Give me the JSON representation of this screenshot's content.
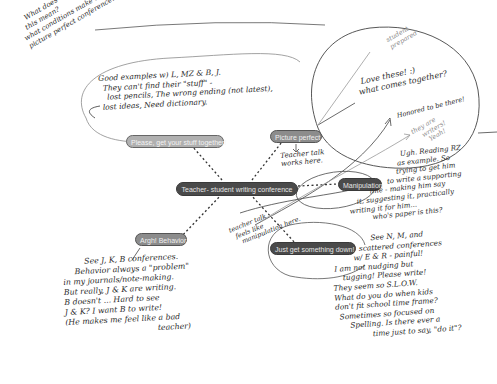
{
  "diagram": {
    "type": "mind-map",
    "central_node": {
      "label": "Teacher- student writing conference"
    },
    "branches": [
      {
        "id": "stuff",
        "label": "Please, get your stuff together!"
      },
      {
        "id": "picture",
        "label": "Picture perfect"
      },
      {
        "id": "manipulation",
        "label": "Manipulation"
      },
      {
        "id": "behavior",
        "label": "Argh! Behavior"
      },
      {
        "id": "down",
        "label": "Just get something down!"
      }
    ]
  },
  "annotations": {
    "top_left_question": {
      "lines": [
        "What does",
        "this mean?",
        "what conditions make a",
        "picture perfect conference?"
      ]
    },
    "stuff_note": {
      "lines": [
        "Good examples w) L, MZ & B, J.",
        "They can't find their \"stuff\" -",
        "lost pencils, The wrong ending (not latest),",
        "lost ideas, Need dictionary."
      ]
    },
    "student_prepared": {
      "lines": [
        "student",
        "prepared"
      ]
    },
    "picture_note": {
      "lines": [
        "Love these! :)",
        "what comes together?"
      ]
    },
    "honored_note": {
      "lines": [
        "Honored to be there!"
      ]
    },
    "they_are_writers": {
      "lines": [
        "they are",
        "writers!",
        "Yeah!"
      ]
    },
    "teacher_talk_picture": {
      "lines": [
        "Teacher talk",
        "works here."
      ]
    },
    "teacher_talk_manip": {
      "lines": [
        "teacher talk",
        "feels like",
        "manipulation here."
      ]
    },
    "manipulation_note": {
      "lines": [
        "Ugh. Reading RZ",
        "as example. So",
        "trying to get him",
        "to write a supporting",
        "line - making him say",
        "it, suggesting it, practically",
        "writing it for him...",
        "who's paper is this?"
      ]
    },
    "behavior_note": {
      "lines": [
        "See J, K, B conferences.",
        "Behavior always a \"problem\"",
        "in my journals/note-making.",
        "But really, J & K are writing.",
        "B doesn't ... Hard to see",
        "J & K? I want B to write!",
        "(He makes me feel like a bad",
        "teacher)"
      ]
    },
    "down_note": {
      "lines": [
        "See N, M, and",
        "scattered conferences",
        "w/ E & R - painful!",
        "I am not nudging but",
        "tugging! Please write!",
        "They seem so S.L.O.W.",
        "What do you do when kids",
        "don't fit school time frame?",
        "Sometimes so focused on",
        "Spelling. Is there ever a",
        "time just to say, \"do it\"?"
      ]
    }
  },
  "colors": {
    "central_fill": "#4a4a4a",
    "manipulation_fill": "#4a4a4a",
    "down_fill": "#4a4a4a",
    "picture_fill": "#8c8c8c",
    "behavior_fill": "#8c8c8c",
    "stuff_fill": "#b0b0b0",
    "ink": "#2a2a2a",
    "faint_ink": "#8a8a8a"
  }
}
